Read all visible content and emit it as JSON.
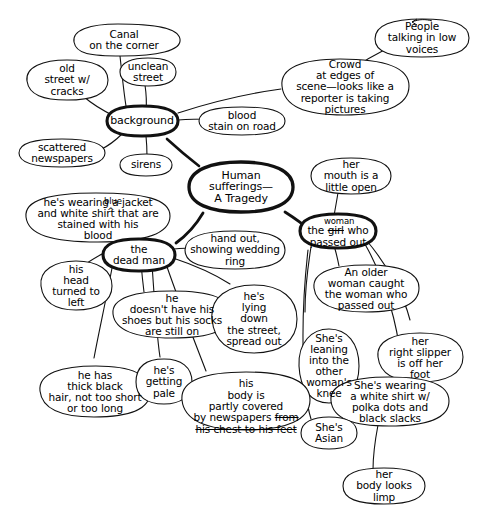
{
  "diagram": {
    "type": "hand-drawn concept map / brainstorm web",
    "ink_color": "#000000",
    "background_color": "#ffffff",
    "nodes": [
      {
        "id": "canal-on-the-corner",
        "name": "canal-on-the-corner",
        "text": "Canal\non the corner",
        "emphasis": "normal"
      },
      {
        "id": "old-street-w-cracks",
        "name": "old-street-with-cracks",
        "text": "old\nstreet w/\ncracks",
        "emphasis": "normal"
      },
      {
        "id": "unclean-street",
        "name": "unclean-street",
        "text": "unclean\nstreet",
        "emphasis": "normal"
      },
      {
        "id": "people-talking-in-low-voices",
        "name": "people-talking-in-low-voices",
        "text": "People\ntalking in low\nvoices",
        "emphasis": "normal"
      },
      {
        "id": "crowd-at-edges",
        "name": "crowd-at-edges-of-scene",
        "text": "Crowd\nat edges of\nscene—looks like a\nreporter is taking\npictures",
        "emphasis": "normal"
      },
      {
        "id": "background",
        "name": "background",
        "text": "background",
        "emphasis": "bold"
      },
      {
        "id": "blood-stain-on-road",
        "name": "blood-stain-on-road",
        "text": "blood\nstain on road",
        "emphasis": "normal"
      },
      {
        "id": "scattered-newspapers",
        "name": "scattered-newspapers",
        "text": "scattered\nnewspapers",
        "emphasis": "normal"
      },
      {
        "id": "sirens",
        "name": "sirens",
        "text": "sirens",
        "emphasis": "normal"
      },
      {
        "id": "human-sufferings",
        "name": "human-sufferings-a-tragedy",
        "text": "Human\nsufferings—\nA Tragedy",
        "emphasis": "bold",
        "role": "central-topic"
      },
      {
        "id": "her-mouth-open",
        "name": "her-mouth-is-a-little-open",
        "text": "her\nmouth is a\nlittle open",
        "emphasis": "normal"
      },
      {
        "id": "hes-wearing-jacket",
        "name": "hes-wearing-blue-jacket-and-white-shirt",
        "text": "he's wearing a jacket\nand white shirt that are\nstained with his\nblood",
        "inserted_word": "blue",
        "inserted_after": "a",
        "emphasis": "normal"
      },
      {
        "id": "woman-who-passed-out",
        "name": "woman-who-passed-out",
        "text_struck": "the girl who",
        "struck_word": "girl",
        "text": "the girl who\npassed out",
        "inserted_word": "woman",
        "emphasis": "bold"
      },
      {
        "id": "hand-out-wedding-ring",
        "name": "hand-out-showing-wedding-ring",
        "text": "hand out,\nshowing wedding\nring",
        "emphasis": "normal"
      },
      {
        "id": "the-dead-man",
        "name": "the-dead-man",
        "text": "the\ndead man",
        "emphasis": "bold"
      },
      {
        "id": "his-head-turned-left",
        "name": "his-head-turned-to-left",
        "text": "his\nhead\nturned to\nleft",
        "emphasis": "normal"
      },
      {
        "id": "an-older-woman-caught",
        "name": "an-older-woman-caught-the-woman",
        "text": "An older\nwoman caught\nthe woman who\npassed out",
        "emphasis": "normal"
      },
      {
        "id": "no-shoes-socks-on",
        "name": "he-doesnt-have-shoes-but-socks-on",
        "text": "he\ndoesn't have his\nshoes but his socks\nare still on",
        "emphasis": "normal"
      },
      {
        "id": "lying-down-street",
        "name": "hes-lying-down-the-street-spread-out",
        "text": "he's\nlying\ndown\nthe street,\nspread out",
        "emphasis": "normal"
      },
      {
        "id": "shes-leaning-knee",
        "name": "shes-leaning-into-other-womans-knee",
        "text": "She's\nleaning\ninto the\nother\nwoman's\nknee",
        "emphasis": "normal"
      },
      {
        "id": "her-right-slipper-off",
        "name": "her-right-slipper-is-off-her-foot",
        "text": "her\nright slipper\nis off her\nfoot",
        "emphasis": "normal"
      },
      {
        "id": "thick-black-hair",
        "name": "he-has-thick-black-hair",
        "text": "he has\nthick black\nhair, not too short\nor too long",
        "emphasis": "normal"
      },
      {
        "id": "hes-getting-pale",
        "name": "hes-getting-pale",
        "text": "he's\ngetting\npale",
        "emphasis": "normal"
      },
      {
        "id": "body-covered-newspapers",
        "name": "his-body-partly-covered-by-newspapers",
        "text": "his\nbody is\npartly covered\nby newspapers from\nhis chest to his feet",
        "struck_text": "from his chest to his feet",
        "emphasis": "normal"
      },
      {
        "id": "shes-asian",
        "name": "shes-asian",
        "text": "She's\nAsian",
        "emphasis": "normal"
      },
      {
        "id": "shes-wearing-polka-dots",
        "name": "shes-wearing-white-shirt-polka-dots",
        "text": "She's wearing\na white shirt w/\npolka dots and\nblack slacks",
        "emphasis": "normal"
      },
      {
        "id": "her-body-looks-limp",
        "name": "her-body-looks-limp",
        "text": "her\nbody looks\nlimp",
        "emphasis": "normal"
      }
    ],
    "edges": [
      {
        "from": "human-sufferings",
        "to": "background"
      },
      {
        "from": "human-sufferings",
        "to": "the-dead-man"
      },
      {
        "from": "human-sufferings",
        "to": "woman-who-passed-out"
      },
      {
        "from": "background",
        "to": "canal-on-the-corner"
      },
      {
        "from": "background",
        "to": "old-street-w-cracks"
      },
      {
        "from": "background",
        "to": "unclean-street"
      },
      {
        "from": "background",
        "to": "blood-stain-on-road"
      },
      {
        "from": "background",
        "to": "crowd-at-edges"
      },
      {
        "from": "background",
        "to": "scattered-newspapers"
      },
      {
        "from": "background",
        "to": "sirens"
      },
      {
        "from": "crowd-at-edges",
        "to": "people-talking-in-low-voices"
      },
      {
        "from": "the-dead-man",
        "to": "hes-wearing-jacket"
      },
      {
        "from": "the-dead-man",
        "to": "his-head-turned-left"
      },
      {
        "from": "the-dead-man",
        "to": "no-shoes-socks-on"
      },
      {
        "from": "the-dead-man",
        "to": "lying-down-street"
      },
      {
        "from": "the-dead-man",
        "to": "hand-out-wedding-ring"
      },
      {
        "from": "the-dead-man",
        "to": "thick-black-hair"
      },
      {
        "from": "the-dead-man",
        "to": "hes-getting-pale"
      },
      {
        "from": "the-dead-man",
        "to": "body-covered-newspapers"
      },
      {
        "from": "woman-who-passed-out",
        "to": "her-mouth-open"
      },
      {
        "from": "woman-who-passed-out",
        "to": "an-older-woman-caught"
      },
      {
        "from": "woman-who-passed-out",
        "to": "shes-leaning-knee"
      },
      {
        "from": "woman-who-passed-out",
        "to": "her-right-slipper-off"
      },
      {
        "from": "woman-who-passed-out",
        "to": "shes-wearing-polka-dots"
      },
      {
        "from": "woman-who-passed-out",
        "to": "shes-asian"
      },
      {
        "from": "shes-wearing-polka-dots",
        "to": "her-body-looks-limp"
      }
    ]
  }
}
